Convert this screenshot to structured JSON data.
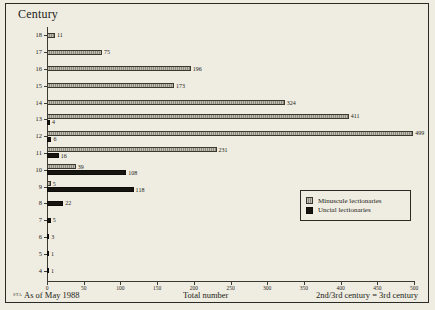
{
  "chart": {
    "title": "Century",
    "axis_title_y": "Century",
    "footer_left": "As of May 1988",
    "footer_left_marker": "STA",
    "footer_center": "Total number",
    "footer_right": "2nd/3rd century = 3rd century"
  },
  "legend": {
    "items": [
      {
        "label": "Minuscule lectionaries",
        "color": "#8e8a7c",
        "key": "minuscule"
      },
      {
        "label": "Uncial lectionaries",
        "color": "#17150f",
        "key": "uncial"
      }
    ]
  },
  "chart_data": {
    "type": "bar",
    "orientation": "horizontal",
    "title": "Century",
    "xlabel": "Total number",
    "ylabel": "Century",
    "xlim": [
      0,
      500
    ],
    "ylim": [
      4,
      18
    ],
    "grid": false,
    "legend_position": "inside-right",
    "xticks": [
      0,
      50,
      100,
      150,
      200,
      250,
      300,
      350,
      400,
      450,
      500
    ],
    "xticklabels": [
      "0",
      "50",
      "100",
      "150",
      "200",
      "250",
      "300",
      "350",
      "400",
      "450",
      "500"
    ],
    "categories": [
      "18",
      "17",
      "16",
      "15",
      "14",
      "13",
      "12",
      "11",
      "10",
      "9",
      "8",
      "7",
      "6",
      "5",
      "4"
    ],
    "series": [
      {
        "name": "Minuscule lectionaries",
        "color": "#8e8a7c",
        "values": [
          11,
          75,
          196,
          173,
          324,
          411,
          499,
          231,
          39,
          5,
          0,
          0,
          0,
          0,
          0
        ]
      },
      {
        "name": "Uncial lectionaries",
        "color": "#17150f",
        "values": [
          0,
          0,
          0,
          0,
          0,
          4,
          6,
          16,
          108,
          118,
          22,
          5,
          3,
          1,
          1
        ]
      }
    ],
    "annotations": [
      "As of May 1988",
      "2nd/3rd century = 3rd century"
    ]
  }
}
